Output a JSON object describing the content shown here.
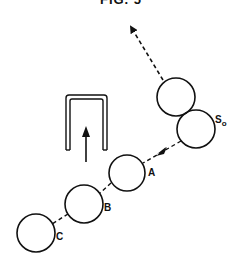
{
  "figure": {
    "title": "FIG. 5",
    "labels": {
      "s0_main": "S",
      "s0_sub": "o",
      "a": "A",
      "b": "B",
      "c": "C"
    },
    "colors": {
      "stroke": "#111111",
      "background": "#ffffff"
    }
  }
}
